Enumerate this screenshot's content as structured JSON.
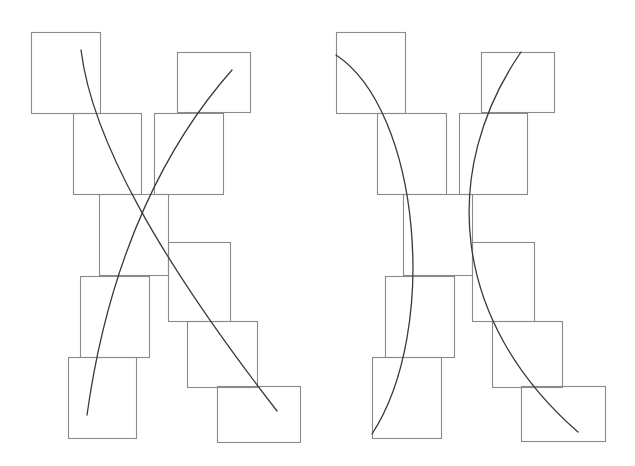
{
  "canvas": {
    "width": 635,
    "height": 466,
    "background": "#ffffff"
  },
  "colors": {
    "box_stroke": "#8a8a8a",
    "curve_stroke": "#3a3a3a"
  },
  "diagrams": [
    {
      "name": "left-diagram",
      "boxes": [
        {
          "x": 31,
          "y": 32,
          "w": 69,
          "h": 81
        },
        {
          "x": 177,
          "y": 52,
          "w": 73,
          "h": 60
        },
        {
          "x": 73,
          "y": 113,
          "w": 68,
          "h": 81
        },
        {
          "x": 154,
          "y": 113,
          "w": 69,
          "h": 81
        },
        {
          "x": 99,
          "y": 194,
          "w": 69,
          "h": 81
        },
        {
          "x": 168,
          "y": 242,
          "w": 62,
          "h": 79
        },
        {
          "x": 80,
          "y": 276,
          "w": 69,
          "h": 81
        },
        {
          "x": 187,
          "y": 321,
          "w": 70,
          "h": 66
        },
        {
          "x": 68,
          "y": 357,
          "w": 68,
          "h": 81
        },
        {
          "x": 217,
          "y": 386,
          "w": 83,
          "h": 56
        }
      ],
      "curves": [
        {
          "d": "M 81 50 C 92 140, 160 260, 277 411"
        },
        {
          "d": "M 232 70 C 170 140, 110 250, 87 415"
        }
      ]
    },
    {
      "name": "right-diagram",
      "boxes": [
        {
          "x": 336,
          "y": 32,
          "w": 69,
          "h": 81
        },
        {
          "x": 481,
          "y": 52,
          "w": 73,
          "h": 60
        },
        {
          "x": 377,
          "y": 113,
          "w": 69,
          "h": 81
        },
        {
          "x": 459,
          "y": 113,
          "w": 68,
          "h": 81
        },
        {
          "x": 403,
          "y": 194,
          "w": 69,
          "h": 81
        },
        {
          "x": 472,
          "y": 242,
          "w": 62,
          "h": 79
        },
        {
          "x": 385,
          "y": 276,
          "w": 69,
          "h": 81
        },
        {
          "x": 492,
          "y": 321,
          "w": 70,
          "h": 66
        },
        {
          "x": 372,
          "y": 357,
          "w": 69,
          "h": 81
        },
        {
          "x": 521,
          "y": 386,
          "w": 84,
          "h": 55
        }
      ],
      "curves": [
        {
          "d": "M 336 55 C 420 110, 440 330, 372 434"
        },
        {
          "d": "M 521 52 C 440 170, 450 320, 578 432"
        }
      ]
    }
  ]
}
